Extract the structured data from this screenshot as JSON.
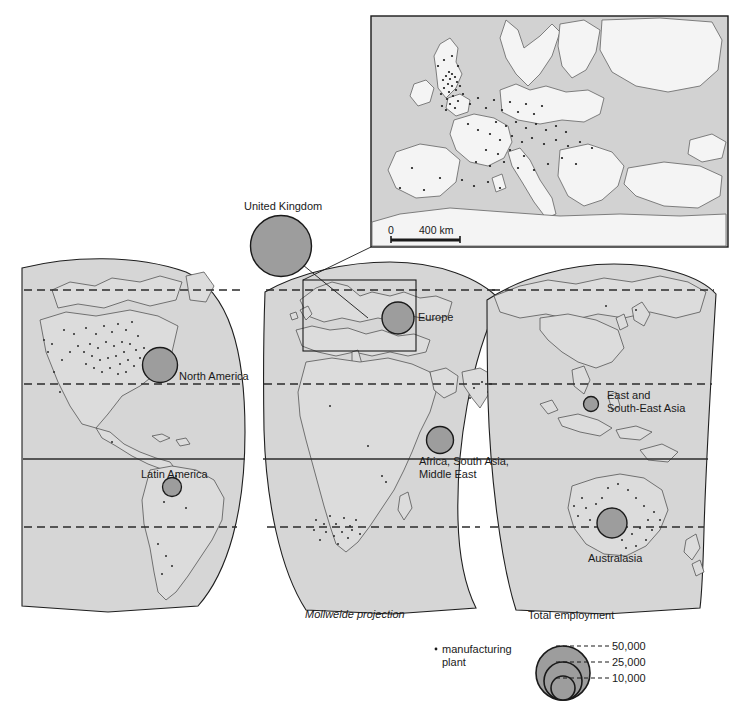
{
  "figure": {
    "projection_note": "Mollweide projection",
    "inset": {
      "scale_zero": "0",
      "scale_label": "400 km"
    }
  },
  "regions": [
    {
      "id": "united-kingdom",
      "label": "United Kingdom",
      "label_x": 244,
      "label_y": 200,
      "circle_cx": 281,
      "circle_cy": 246,
      "circle_r": 30.5,
      "on_inset_callout": true
    },
    {
      "id": "north-america",
      "label": "North America",
      "label_x": 179,
      "label_y": 370,
      "circle_cx": 160,
      "circle_cy": 365,
      "circle_r": 17.5
    },
    {
      "id": "latin-america",
      "label": "Latin America",
      "label_x": 141,
      "label_y": 468,
      "circle_cx": 172,
      "circle_cy": 487,
      "circle_r": 9.5
    },
    {
      "id": "europe",
      "label": "Europe",
      "label_x": 418,
      "label_y": 311,
      "circle_cx": 398,
      "circle_cy": 318,
      "circle_r": 16
    },
    {
      "id": "africa-south-asia-middle-east",
      "label": "Africa, South Asia,\nMiddle East",
      "label_x": 419,
      "label_y": 460,
      "circle_cx": 440,
      "circle_cy": 440,
      "circle_r": 13.5
    },
    {
      "id": "east-and-south-east-asia",
      "label": "East and\nSouth-East Asia",
      "label_x": 607,
      "label_y": 395,
      "circle_cx": 591,
      "circle_cy": 404,
      "circle_r": 7.5
    },
    {
      "id": "australasia",
      "label": "Australasia",
      "label_x": 588,
      "label_y": 558,
      "circle_cx": 612,
      "circle_cy": 523,
      "circle_r": 15
    }
  ],
  "legend": {
    "title": "Total employment",
    "title_x": 528,
    "title_y": 615,
    "plant_marker_label": "manufacturing\nplant",
    "plant_marker_x": 442,
    "plant_marker_y": 645,
    "classes": [
      {
        "value": "50,000",
        "r": 27,
        "label_x": 614,
        "label_y": 637
      },
      {
        "value": "25,000",
        "r": 19,
        "label_x": 614,
        "label_y": 655
      },
      {
        "value": "10,000",
        "r": 12,
        "label_x": 614,
        "label_y": 673
      }
    ]
  },
  "colors": {
    "circle_fill": "#9d9d9d",
    "circle_stroke": "#1a1a1a",
    "map_fill": "#d4d4d4",
    "map_stroke": "#4a4a4a",
    "inset_sea": "#d2d2d2",
    "inset_land": "#f2f2f2",
    "frame": "#1a1a1a",
    "text": "#1a1a1a"
  }
}
